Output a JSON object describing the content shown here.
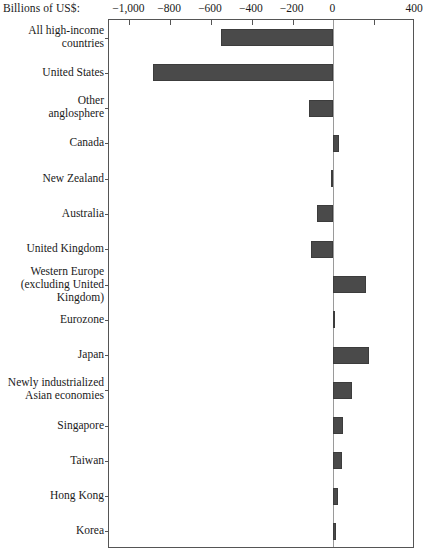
{
  "chart_data": {
    "type": "bar",
    "orientation": "horizontal",
    "title": "",
    "xlabel": "Billions of US$:",
    "ylabel": "",
    "xlim": [
      -1100,
      400
    ],
    "xticks": [
      -1000,
      -800,
      -600,
      -400,
      -200,
      0,
      400
    ],
    "xtick_labels": [
      "−1,000",
      "−800",
      "−600",
      "−400",
      "−200",
      "0",
      "400"
    ],
    "xticks_drawn": [
      -1000,
      -800,
      -600,
      -400,
      -200,
      200
    ],
    "grid": false,
    "legend": null,
    "zero_line": true,
    "categories": [
      "All high-income\ncountries",
      "United States",
      "Other\nanglosphere",
      "Canada",
      "New Zealand",
      "Australia",
      "United Kingdom",
      "Western Europe\n(excluding United\nKingdom)",
      "Eurozone",
      "Japan",
      "Newly industrialized\nAsian economies",
      "Singapore",
      "Taiwan",
      "Hong Kong",
      "Korea"
    ],
    "values": [
      -552,
      -883,
      -120,
      28,
      -12,
      -78,
      -110,
      160,
      8,
      175,
      92,
      48,
      40,
      25,
      15
    ],
    "bar_color": "#4a4a4a",
    "axis_color": "#555555",
    "zero_line_color": "#9a9a9a",
    "background": "#ffffff"
  }
}
